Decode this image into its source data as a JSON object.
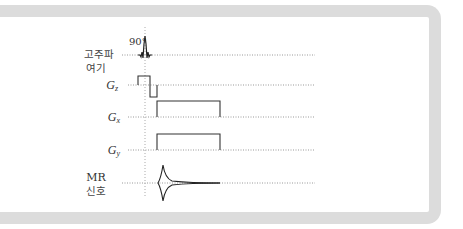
{
  "diagram": {
    "rows": [
      {
        "id": "rf",
        "label_lines": [
          "고주파",
          "여기"
        ],
        "annotation": "90°"
      },
      {
        "id": "gz",
        "label_main": "G",
        "label_sub": "z"
      },
      {
        "id": "gx",
        "label_main": "G",
        "label_sub": "x"
      },
      {
        "id": "gy",
        "label_main": "G",
        "label_sub": "y"
      },
      {
        "id": "mr",
        "label_lines": [
          "MR",
          "신호"
        ]
      }
    ],
    "colors": {
      "frame": "#dcdcdc",
      "trace": "#333333",
      "guide": "#999999"
    }
  }
}
